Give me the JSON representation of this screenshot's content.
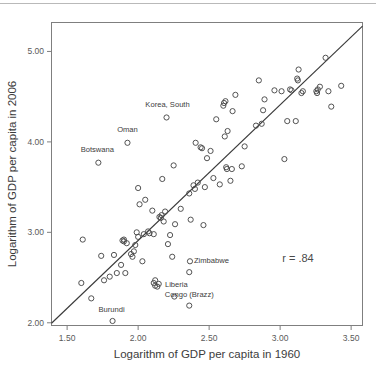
{
  "figure": {
    "background_color": "#ffffff",
    "frame_color": "#7f7f7f",
    "marker_color": "#4a4a4a",
    "line_color": "#3a3a3a",
    "text_color": "#3c3c3c"
  },
  "annotations": {
    "correlation_label": "r = .84"
  },
  "ghost_artifacts": [
    {
      "text": "",
      "x": 88,
      "y": 8
    },
    {
      "text": "",
      "x": 240,
      "y": 8
    }
  ],
  "chart_data": {
    "type": "scatter",
    "title": "",
    "xlabel": "Logarithm of GDP per capita in 1960",
    "ylabel": "Logarithm of GDP per capita in 2006",
    "xlim": [
      1.39,
      3.58
    ],
    "ylim": [
      1.97,
      5.32
    ],
    "xticks": [
      1.5,
      2.0,
      2.5,
      3.0,
      3.5
    ],
    "xticklabels": [
      "1.50",
      "2.00",
      "2.50",
      "3.00",
      "3.50"
    ],
    "yticks": [
      2.0,
      3.0,
      4.0,
      5.0
    ],
    "yticklabels": [
      "2.00",
      "3.00",
      "4.00",
      "5.00"
    ],
    "grid": false,
    "legend": false,
    "correlation": 0.84,
    "marker": "open-circle",
    "fit_line": {
      "type": "linear-regression",
      "x0": 1.39,
      "y0": 1.995,
      "x1": 3.58,
      "y1": 5.28
    },
    "points": [
      {
        "x": 1.61,
        "y": 2.92
      },
      {
        "x": 1.6,
        "y": 2.44
      },
      {
        "x": 1.67,
        "y": 2.27
      },
      {
        "x": 1.72,
        "y": 3.77,
        "label": "Botswana",
        "label_dx": -1,
        "label_dy": -11
      },
      {
        "x": 1.74,
        "y": 2.74
      },
      {
        "x": 1.76,
        "y": 2.47
      },
      {
        "x": 1.8,
        "y": 2.51
      },
      {
        "x": 1.82,
        "y": 2.02,
        "label": "Burundi",
        "label_dx": -1,
        "label_dy": -9
      },
      {
        "x": 1.83,
        "y": 2.75
      },
      {
        "x": 1.85,
        "y": 2.55
      },
      {
        "x": 1.88,
        "y": 2.64
      },
      {
        "x": 1.89,
        "y": 2.91
      },
      {
        "x": 1.9,
        "y": 2.9
      },
      {
        "x": 1.9,
        "y": 2.92
      },
      {
        "x": 1.91,
        "y": 2.55
      },
      {
        "x": 1.92,
        "y": 2.88
      },
      {
        "x": 1.925,
        "y": 3.99,
        "label": "Oman",
        "label_dx": 0,
        "label_dy": -11
      },
      {
        "x": 1.95,
        "y": 2.76
      },
      {
        "x": 1.96,
        "y": 2.73
      },
      {
        "x": 1.97,
        "y": 2.79
      },
      {
        "x": 1.98,
        "y": 2.86
      },
      {
        "x": 1.99,
        "y": 3.0
      },
      {
        "x": 2.0,
        "y": 3.49
      },
      {
        "x": 2.0,
        "y": 2.95
      },
      {
        "x": 2.01,
        "y": 3.31
      },
      {
        "x": 2.03,
        "y": 2.68
      },
      {
        "x": 2.04,
        "y": 2.98
      },
      {
        "x": 2.05,
        "y": 3.36
      },
      {
        "x": 2.07,
        "y": 3.01
      },
      {
        "x": 2.08,
        "y": 2.99
      },
      {
        "x": 2.1,
        "y": 3.24
      },
      {
        "x": 2.11,
        "y": 2.98
      },
      {
        "x": 2.11,
        "y": 2.44
      },
      {
        "x": 2.12,
        "y": 2.41
      },
      {
        "x": 2.12,
        "y": 2.47
      },
      {
        "x": 2.135,
        "y": 2.4
      },
      {
        "x": 2.145,
        "y": 2.43
      },
      {
        "x": 2.15,
        "y": 3.17
      },
      {
        "x": 2.16,
        "y": 3.16
      },
      {
        "x": 2.165,
        "y": 3.19
      },
      {
        "x": 2.17,
        "y": 3.59
      },
      {
        "x": 2.18,
        "y": 3.12
      },
      {
        "x": 2.19,
        "y": 3.23
      },
      {
        "x": 2.2,
        "y": 4.27,
        "label": "Korea, South",
        "label_dx": 1,
        "label_dy": -10
      },
      {
        "x": 2.21,
        "y": 2.87
      },
      {
        "x": 2.225,
        "y": 2.97
      },
      {
        "x": 2.24,
        "y": 2.73
      },
      {
        "x": 2.25,
        "y": 3.74
      },
      {
        "x": 2.255,
        "y": 2.29,
        "label": "Liberia",
        "label_dx": 2,
        "label_dy": -10
      },
      {
        "x": 2.26,
        "y": 3.09
      },
      {
        "x": 2.3,
        "y": 3.26
      },
      {
        "x": 2.36,
        "y": 2.19,
        "label": "Congo (Brazz)",
        "label_dx": 0,
        "label_dy": -9
      },
      {
        "x": 2.36,
        "y": 2.56
      },
      {
        "x": 2.36,
        "y": 3.43
      },
      {
        "x": 2.365,
        "y": 2.68,
        "label": "Zimbabwe",
        "label_dx": 4,
        "label_dy": 2
      },
      {
        "x": 2.37,
        "y": 3.14
      },
      {
        "x": 2.39,
        "y": 3.52
      },
      {
        "x": 2.4,
        "y": 3.48
      },
      {
        "x": 2.405,
        "y": 3.99
      },
      {
        "x": 2.42,
        "y": 3.55
      },
      {
        "x": 2.44,
        "y": 3.94
      },
      {
        "x": 2.45,
        "y": 3.93
      },
      {
        "x": 2.46,
        "y": 3.08
      },
      {
        "x": 2.47,
        "y": 3.5
      },
      {
        "x": 2.485,
        "y": 3.82
      },
      {
        "x": 2.51,
        "y": 3.9
      },
      {
        "x": 2.53,
        "y": 3.6
      },
      {
        "x": 2.55,
        "y": 4.25
      },
      {
        "x": 2.575,
        "y": 3.53
      },
      {
        "x": 2.6,
        "y": 4.4
      },
      {
        "x": 2.605,
        "y": 4.43
      },
      {
        "x": 2.61,
        "y": 4.06
      },
      {
        "x": 2.615,
        "y": 4.45
      },
      {
        "x": 2.62,
        "y": 3.72
      },
      {
        "x": 2.625,
        "y": 3.7
      },
      {
        "x": 2.63,
        "y": 4.12
      },
      {
        "x": 2.65,
        "y": 3.57
      },
      {
        "x": 2.66,
        "y": 3.7
      },
      {
        "x": 2.665,
        "y": 4.34
      },
      {
        "x": 2.685,
        "y": 4.52
      },
      {
        "x": 2.73,
        "y": 3.73
      },
      {
        "x": 2.75,
        "y": 3.95
      },
      {
        "x": 2.83,
        "y": 4.18
      },
      {
        "x": 2.85,
        "y": 4.68
      },
      {
        "x": 2.87,
        "y": 4.2
      },
      {
        "x": 2.88,
        "y": 4.35
      },
      {
        "x": 2.89,
        "y": 4.47
      },
      {
        "x": 2.96,
        "y": 4.57
      },
      {
        "x": 3.01,
        "y": 4.56
      },
      {
        "x": 3.03,
        "y": 3.81
      },
      {
        "x": 3.05,
        "y": 4.23
      },
      {
        "x": 3.07,
        "y": 4.58
      },
      {
        "x": 3.08,
        "y": 4.57
      },
      {
        "x": 3.11,
        "y": 4.23
      },
      {
        "x": 3.12,
        "y": 4.7
      },
      {
        "x": 3.125,
        "y": 4.68
      },
      {
        "x": 3.13,
        "y": 4.8
      },
      {
        "x": 3.15,
        "y": 4.54
      },
      {
        "x": 3.16,
        "y": 4.56
      },
      {
        "x": 3.255,
        "y": 4.56
      },
      {
        "x": 3.26,
        "y": 4.54
      },
      {
        "x": 3.265,
        "y": 4.58
      },
      {
        "x": 3.28,
        "y": 4.61
      },
      {
        "x": 3.32,
        "y": 4.93
      },
      {
        "x": 3.34,
        "y": 4.56
      },
      {
        "x": 3.36,
        "y": 4.39
      },
      {
        "x": 3.43,
        "y": 4.62
      }
    ]
  }
}
